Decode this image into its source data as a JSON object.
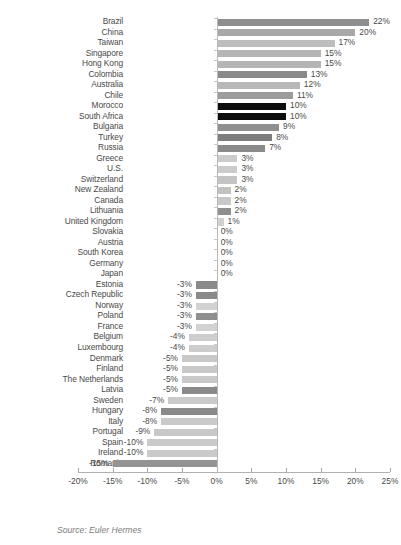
{
  "title_remnant": "",
  "source_note": "Source: Euler Hermes",
  "axis": {
    "ticks": [
      "-20%",
      "-15%",
      "-10%",
      "-5%",
      "0%",
      "5%",
      "10%",
      "15%",
      "20%",
      "25%"
    ],
    "tick_values": [
      -20,
      -15,
      -10,
      -5,
      0,
      5,
      10,
      15,
      20,
      25
    ]
  },
  "chart_data": {
    "type": "bar",
    "orientation": "horizontal",
    "title": "",
    "subtitle": "",
    "xlabel": "",
    "ylabel": "",
    "xlim": [
      -20,
      25
    ],
    "grid": false,
    "legend": false,
    "source": "Source: Euler Hermes",
    "unit": "%",
    "categories": [
      "Brazil",
      "China",
      "Taiwan",
      "Singapore",
      "Hong Kong",
      "Colombia",
      "Australia",
      "Chile",
      "Morocco",
      "South Africa",
      "Bulgaria",
      "Turkey",
      "Russia",
      "Greece",
      "U.S.",
      "Switzerland",
      "New Zealand",
      "Canada",
      "Lithuania",
      "United Kingdom",
      "Slovakia",
      "Austria",
      "South Korea",
      "Germany",
      "Japan",
      "Estonia",
      "Czech Republic",
      "Norway",
      "Poland",
      "France",
      "Belgium",
      "Luxembourg",
      "Denmark",
      "Finland",
      "The Netherlands",
      "Latvia",
      "Sweden",
      "Hungary",
      "Italy",
      "Portugal",
      "Spain",
      "Ireland",
      "Romania"
    ],
    "values": [
      22,
      20,
      17,
      15,
      15,
      13,
      12,
      11,
      10,
      10,
      9,
      8,
      7,
      3,
      3,
      3,
      2,
      2,
      2,
      1,
      0,
      0,
      0,
      0,
      0,
      -3,
      -3,
      -3,
      -3,
      -3,
      -4,
      -4,
      -5,
      -5,
      -5,
      -5,
      -7,
      -8,
      -8,
      -9,
      -10,
      -10,
      -15
    ],
    "data_labels": [
      "22%",
      "20%",
      "17%",
      "15%",
      "15%",
      "13%",
      "12%",
      "11%",
      "10%",
      "10%",
      "9%",
      "8%",
      "7%",
      "3%",
      "3%",
      "3%",
      "2%",
      "2%",
      "2%",
      "1%",
      "0%",
      "0%",
      "0%",
      "0%",
      "0%",
      "-3%",
      "-3%",
      "-3%",
      "-3%",
      "-3%",
      "-4%",
      "-4%",
      "-5%",
      "-5%",
      "-5%",
      "-5%",
      "-7%",
      "-8%",
      "-8%",
      "-9%",
      "-10%",
      "-10%",
      "-15%"
    ],
    "bar_colors": [
      "#8e8e8e",
      "#a8a8a8",
      "#bdbdbd",
      "#b5b5b5",
      "#b5b5b5",
      "#8a8a8a",
      "#b8b8b8",
      "#9c9c9c",
      "#0d0d0d",
      "#0d0d0d",
      "#8f8f8f",
      "#7e7e7e",
      "#8a8a8a",
      "#cccccc",
      "#cccccc",
      "#c4c4c4",
      "#c2c2c2",
      "#c8c8c8",
      "#8f8f8f",
      "#d0d0d0",
      "#cfcfcf",
      "#cfcfcf",
      "#cfcfcf",
      "#cfcfcf",
      "#cfcfcf",
      "#8a8a8a",
      "#8a8a8a",
      "#d2d2d2",
      "#8f8f8f",
      "#d2d2d2",
      "#cdcdcd",
      "#cdcdcd",
      "#c9c9c9",
      "#c9c9c9",
      "#c9c9c9",
      "#8a8a8a",
      "#cacaca",
      "#8a8a8a",
      "#cacaca",
      "#c8c8c8",
      "#cacaca",
      "#cacaca",
      "#949494"
    ]
  },
  "colors": {
    "axis": "#b0b0b0",
    "text": "#4a4a4a",
    "source_text": "#7d7d7d",
    "dark_bar": "#0d0d0d",
    "mid_bar": "#8a8a8a",
    "light_bar": "#cacaca",
    "background": "#ffffff"
  }
}
